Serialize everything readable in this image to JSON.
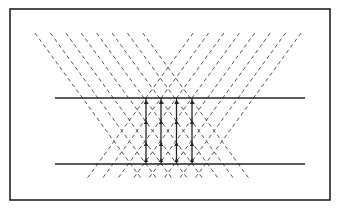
{
  "diagram": {
    "frame": {
      "x": 10,
      "y": 9,
      "width": 320,
      "height": 191,
      "stroke": "#222222"
    },
    "dashed_lines": {
      "count_per_family": 8,
      "top_y": 33,
      "bottom_y": 178,
      "spacing": 15.4,
      "backslash_top_x_start": 35,
      "slash_top_x_start": 301,
      "dx_over_dy": 0.73,
      "stroke": "#555555",
      "dash": "4,3"
    },
    "horizontal_lines": [
      {
        "y": 98,
        "x1": 55,
        "x2": 305
      },
      {
        "y": 164,
        "x1": 55,
        "x2": 305
      }
    ],
    "vertical_lines": [
      {
        "x": 146,
        "y1": 98,
        "y2": 164
      },
      {
        "x": 161,
        "y1": 98,
        "y2": 164
      },
      {
        "x": 176.5,
        "y1": 98,
        "y2": 164
      },
      {
        "x": 192,
        "y1": 98,
        "y2": 164
      }
    ],
    "line_color": "#222222"
  }
}
